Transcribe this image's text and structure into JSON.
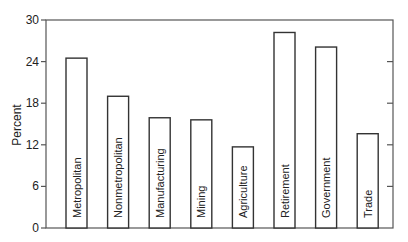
{
  "chart_data": {
    "type": "bar",
    "title": "",
    "xlabel": "",
    "ylabel": "Percent",
    "ylim": [
      0,
      30
    ],
    "yticks": [
      0,
      6,
      12,
      18,
      24,
      30
    ],
    "grid": false,
    "legend": null,
    "bar_labels_inside_rotated": true,
    "categories": [
      "Metropolitan",
      "Nonmetropolitan",
      "Manufacturing",
      "Mining",
      "Agriculture",
      "Retirement",
      "Government",
      "Trade"
    ],
    "values": [
      24.5,
      19.0,
      15.9,
      15.6,
      11.7,
      28.2,
      26.1,
      13.6
    ]
  },
  "style": {
    "bar_fill": "#ffffff",
    "bar_stroke": "#333333",
    "axis_color": "#555555"
  }
}
